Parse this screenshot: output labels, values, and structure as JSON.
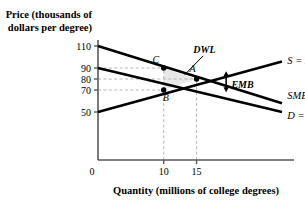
{
  "chart_data": {
    "type": "line",
    "title": "",
    "xlabel": "Quantity (millions of college degrees)",
    "ylabel_line1": "Price (thousands of",
    "ylabel_line2": "dollars per degree)",
    "origin_label": "0",
    "xlim": [
      0,
      28
    ],
    "ylim": [
      0,
      120
    ],
    "x_ticks": [
      10,
      15
    ],
    "x_tick_labels": [
      "10",
      "15"
    ],
    "y_ticks": [
      110,
      90,
      80,
      70,
      50
    ],
    "y_tick_labels": [
      "110",
      "90",
      "80",
      "70",
      "50"
    ],
    "grid": false,
    "dashed_guides": [
      {
        "name": "q-10-vertical",
        "x": 10,
        "y_from": 0,
        "y_to": 90
      },
      {
        "name": "q-15-vertical",
        "x": 15,
        "y_from": 0,
        "y_to": 80
      },
      {
        "name": "p-90-horizontal",
        "y": 90,
        "x_from": 0,
        "x_to": 10
      },
      {
        "name": "p-80-horizontal",
        "y": 80,
        "x_from": 0,
        "x_to": 15
      },
      {
        "name": "p-70-horizontal",
        "y": 70,
        "x_from": 0,
        "x_to": 10
      }
    ],
    "series": [
      {
        "name": "SMB",
        "label": "SMB",
        "label_sub": "",
        "points": [
          [
            0,
            110
          ],
          [
            28,
            58
          ]
        ],
        "label_x": 28.8,
        "label_y": 62
      },
      {
        "name": "D = MBp",
        "label": "D = MB",
        "label_sub": "p",
        "points": [
          [
            0,
            90
          ],
          [
            28,
            50
          ]
        ],
        "label_x": 28.8,
        "label_y": 44
      },
      {
        "name": "S = MC",
        "label": "S = MC",
        "label_sub": "",
        "points": [
          [
            0,
            50
          ],
          [
            28,
            96
          ]
        ],
        "label_x": 28.8,
        "label_y": 94
      }
    ],
    "points": [
      {
        "name": "A",
        "label": "A",
        "x": 15,
        "y": 80,
        "label_dx": -4,
        "label_dy": -7
      },
      {
        "name": "B",
        "label": "B",
        "x": 10,
        "y": 70,
        "label_dx": 2,
        "label_dy": 11
      },
      {
        "name": "C",
        "label": "C",
        "x": 10,
        "y": 90,
        "label_dx": -8,
        "label_dy": -5
      }
    ],
    "shaded_region": {
      "name": "DWL",
      "label": "DWL",
      "vertices": [
        [
          10,
          90
        ],
        [
          15,
          80
        ],
        [
          10,
          70
        ]
      ],
      "fill": "#e8e8e8",
      "label_x": 16.2,
      "label_y": 104,
      "leader_from": [
        16.0,
        101
      ],
      "leader_to": [
        13.2,
        84
      ]
    },
    "annotations": [
      {
        "name": "EMB",
        "label": "EMB",
        "arrow_x": 19.5,
        "arrow_y_top": 84,
        "arrow_y_bottom": 71,
        "label_x": 20.3,
        "label_y": 72
      }
    ],
    "colors": {
      "line": "#000000",
      "axis": "#595959",
      "dashed_guide": "#b5b5b5",
      "dwl_fill": "#e8e8e8",
      "background": "#ffffff"
    }
  }
}
